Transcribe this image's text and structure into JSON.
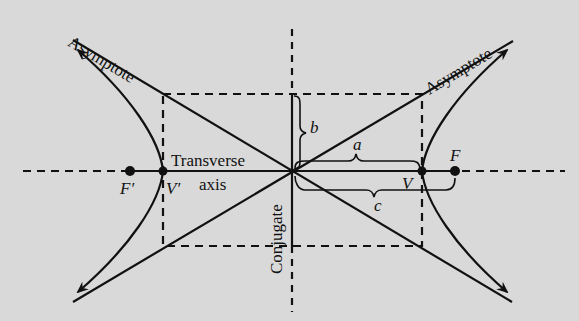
{
  "diagram": {
    "colors": {
      "background": "#d9d9d9",
      "ink": "#111111"
    },
    "labels": {
      "asymptote_left": "Asymptote",
      "asymptote_right": "Asymptote",
      "transverse_line1": "Transverse",
      "transverse_line2": "axis",
      "conjugate": "Conjugate",
      "focus_left": "F′",
      "focus_right": "F",
      "vertex_left": "V′",
      "vertex_right": "V",
      "semi_transverse": "a",
      "semi_conjugate": "b",
      "focal_distance": "c"
    },
    "geometry": {
      "center": [
        292,
        171
      ],
      "rectangle": {
        "x1": 163,
        "y1": 94,
        "x2": 422,
        "y2": 246
      },
      "foci": [
        [
          130,
          171
        ],
        [
          455,
          171
        ]
      ],
      "vertices": [
        [
          163,
          171
        ],
        [
          422,
          171
        ]
      ]
    }
  }
}
